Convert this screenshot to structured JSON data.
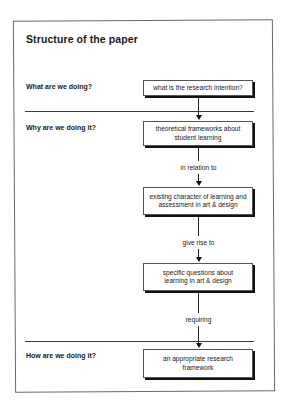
{
  "diagram": {
    "title": "Structure of the paper",
    "rows": [
      {
        "label": "What are we doing?"
      },
      {
        "label": "Why are we doing it?"
      },
      {
        "label": "How are we doing it?"
      }
    ],
    "boxes": [
      {
        "text": "what is the research intention?"
      },
      {
        "text": "theoretical frameworks about student learning"
      },
      {
        "text": "existing character of learning and assessment in art & design"
      },
      {
        "text": "specific questions about learning in art & design"
      },
      {
        "text": "an appropriate research framework"
      }
    ],
    "connectors": [
      {
        "label": ""
      },
      {
        "label": "in relation to"
      },
      {
        "label": "give rise to"
      },
      {
        "label": "requiring"
      }
    ],
    "colors": {
      "line": "#222222",
      "box_border": "#555555",
      "box_shadow": "#111111",
      "background": "#ffffff"
    }
  }
}
